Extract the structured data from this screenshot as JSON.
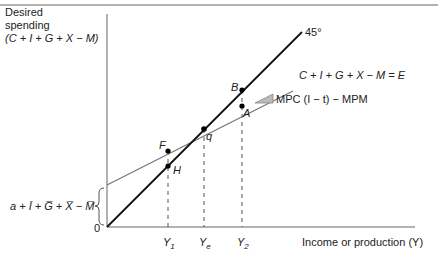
{
  "diagram": {
    "type": "keynesian-cross",
    "y_axis_label_lines": [
      "Desired",
      "spending",
      "(C + I + G + X − M)"
    ],
    "x_axis_label": "Income or production (Y)",
    "origin_label": "0",
    "intercept_label": "a + Ī + G̅ + X̅ − M̅",
    "line_45_label": "45°",
    "ae_line_label": "C + I + G + X − M = E",
    "slope_label": "MPC (I − t) − MPM",
    "points": [
      {
        "name": "B",
        "label": "B"
      },
      {
        "name": "A",
        "label": "A"
      },
      {
        "name": "q",
        "label": "q"
      },
      {
        "name": "F",
        "label": "F"
      },
      {
        "name": "H",
        "label": "H"
      }
    ],
    "x_ticks": [
      {
        "label": "Y",
        "sub": "1"
      },
      {
        "label": "Y",
        "sub": "e"
      },
      {
        "label": "Y",
        "sub": "2"
      }
    ]
  },
  "colors": {
    "axis": "#666666",
    "line_45": "#111111",
    "ae_line": "#777777",
    "guide": "#555555",
    "triangle_fill": "#bbbbbb",
    "top_rule": "#999999"
  }
}
